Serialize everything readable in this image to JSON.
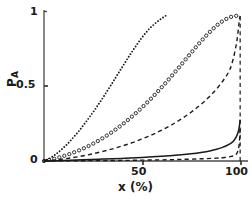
{
  "chart_data": {
    "type": "line",
    "title": "",
    "xlabel": "x (%)",
    "ylabel": "P_A",
    "ylabel_base": "P",
    "ylabel_sub": "A",
    "xlim": [
      0,
      104
    ],
    "ylim": [
      0,
      1.03
    ],
    "grid": false,
    "legend": "none",
    "xticks": [
      50,
      100
    ],
    "xtick_labels": [
      "50",
      "100"
    ],
    "yticks": [
      0,
      0.5,
      1
    ],
    "ytick_labels": [
      "0",
      "0.5",
      "1"
    ],
    "series": [
      {
        "name": "curve-dots-steepest",
        "style": "dotted-small",
        "marker": "dot",
        "color": "#1a1a1a",
        "x": [
          0,
          2,
          4,
          6,
          8,
          10,
          12,
          14,
          16,
          18,
          20,
          22,
          24,
          26,
          28,
          30,
          32,
          34,
          36,
          38,
          40,
          42,
          44,
          46,
          48,
          50,
          52,
          54,
          56,
          58,
          60,
          62
        ],
        "y": [
          0.0,
          0.012,
          0.028,
          0.046,
          0.068,
          0.092,
          0.118,
          0.148,
          0.178,
          0.21,
          0.245,
          0.28,
          0.318,
          0.355,
          0.395,
          0.435,
          0.478,
          0.52,
          0.563,
          0.607,
          0.65,
          0.693,
          0.735,
          0.775,
          0.815,
          0.852,
          0.885,
          0.915,
          0.94,
          0.962,
          0.982,
          1.0
        ]
      },
      {
        "name": "curve-circles",
        "style": "dotted-circles",
        "marker": "circle",
        "color": "#1a1a1a",
        "x": [
          0,
          3,
          6,
          9,
          12,
          15,
          18,
          21,
          24,
          27,
          30,
          33,
          36,
          39,
          42,
          45,
          48,
          51,
          54,
          57,
          60,
          63,
          66,
          69,
          72,
          75,
          78,
          81,
          84,
          87,
          90,
          93,
          96,
          98
        ],
        "y": [
          0.0,
          0.008,
          0.018,
          0.03,
          0.043,
          0.058,
          0.074,
          0.092,
          0.112,
          0.134,
          0.158,
          0.184,
          0.212,
          0.242,
          0.274,
          0.308,
          0.344,
          0.382,
          0.422,
          0.464,
          0.508,
          0.553,
          0.6,
          0.648,
          0.697,
          0.745,
          0.793,
          0.839,
          0.882,
          0.921,
          0.954,
          0.979,
          0.996,
          1.0
        ]
      },
      {
        "name": "curve-dashed-rising",
        "style": "dashed",
        "marker": "none",
        "color": "#1a1a1a",
        "x": [
          0,
          5,
          10,
          15,
          20,
          25,
          30,
          35,
          40,
          45,
          50,
          55,
          60,
          65,
          70,
          75,
          80,
          85,
          90,
          94,
          96,
          98,
          99,
          99.5,
          100
        ],
        "y": [
          0.0,
          0.006,
          0.014,
          0.024,
          0.036,
          0.05,
          0.066,
          0.084,
          0.104,
          0.126,
          0.152,
          0.18,
          0.212,
          0.248,
          0.29,
          0.336,
          0.39,
          0.452,
          0.53,
          0.61,
          0.68,
          0.8,
          0.9,
          0.96,
          1.0
        ]
      },
      {
        "name": "curve-solid-low",
        "style": "solid",
        "marker": "none",
        "color": "#1a1a1a",
        "x": [
          0,
          10,
          20,
          30,
          40,
          50,
          60,
          70,
          75,
          80,
          85,
          88,
          91,
          93,
          95,
          96.5,
          97.5,
          98.3,
          99,
          99.4,
          99.7,
          100
        ],
        "y": [
          0.0,
          0.004,
          0.008,
          0.013,
          0.018,
          0.024,
          0.032,
          0.043,
          0.05,
          0.059,
          0.071,
          0.081,
          0.094,
          0.105,
          0.12,
          0.136,
          0.155,
          0.175,
          0.2,
          0.223,
          0.25,
          0.285
        ]
      },
      {
        "name": "curve-dashed-flat",
        "style": "dashed",
        "marker": "none",
        "color": "#1a1a1a",
        "x": [
          0,
          10,
          20,
          30,
          40,
          50,
          60,
          70,
          80,
          88,
          92,
          95,
          97,
          98.2,
          99,
          99.5,
          99.8,
          100
        ],
        "y": [
          0.0,
          0.001,
          0.002,
          0.003,
          0.004,
          0.006,
          0.008,
          0.011,
          0.015,
          0.02,
          0.024,
          0.03,
          0.038,
          0.05,
          0.075,
          0.115,
          0.17,
          0.235
        ]
      }
    ]
  },
  "axes": {
    "x_title": "x (%)",
    "y_title_base": "P",
    "y_title_sub": "A",
    "xtick_50": "50",
    "xtick_100": "100",
    "ytick_0": "0",
    "ytick_05": "0.5",
    "ytick_1": "1"
  },
  "colors": {
    "ink": "#1a1a1a",
    "axis": "#555555",
    "background": "#ffffff"
  }
}
